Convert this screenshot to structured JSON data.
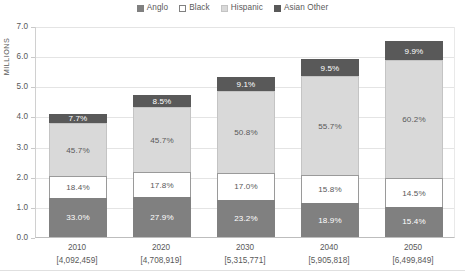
{
  "chart_data": {
    "type": "bar",
    "subtype": "stacked-100-percent",
    "title": "",
    "xlabel": "",
    "ylabel": "MILLIONS",
    "ylim": [
      0.0,
      7.0
    ],
    "ytick_labels": [
      "0.0",
      "1.0",
      "2.0",
      "3.0",
      "4.0",
      "5.0",
      "6.0",
      "7.0"
    ],
    "ytick_values": [
      0.0,
      1.0,
      2.0,
      3.0,
      4.0,
      5.0,
      6.0,
      7.0
    ],
    "grid": true,
    "legend_position": "top-center",
    "categories": [
      "2010",
      "2020",
      "2030",
      "2040",
      "2050"
    ],
    "category_totals_label": [
      "[4,092,459]",
      "[4,708,919]",
      "[5,315,771]",
      "[5,905,818]",
      "[6,499,849]"
    ],
    "category_totals": [
      4092459,
      4708919,
      5315771,
      5905818,
      6499849
    ],
    "series": [
      {
        "name": "Anglo",
        "color": "#808080",
        "border": "#808080",
        "label_on": "dark",
        "values": [
          33.0,
          27.9,
          23.2,
          18.9,
          15.4
        ],
        "value_labels": [
          "33.0%",
          "27.9%",
          "23.2%",
          "18.9%",
          "15.4%"
        ]
      },
      {
        "name": "Black",
        "color": "#ffffff",
        "border": "#9a9a9a",
        "label_on": "light",
        "values": [
          18.4,
          17.8,
          17.0,
          15.8,
          14.5
        ],
        "value_labels": [
          "18.4%",
          "17.8%",
          "17.0%",
          "15.8%",
          "14.5%"
        ]
      },
      {
        "name": "Hispanic",
        "color": "#d9d9d9",
        "border": "#c4c4c4",
        "label_on": "light",
        "values": [
          45.7,
          45.7,
          50.8,
          55.7,
          60.2
        ],
        "value_labels": [
          "45.7%",
          "45.7%",
          "50.8%",
          "55.7%",
          "60.2%"
        ]
      },
      {
        "name": "Asian Other",
        "color": "#595959",
        "border": "#595959",
        "label_on": "dark",
        "values": [
          7.7,
          8.5,
          9.1,
          9.5,
          9.9
        ],
        "value_labels": [
          "7.7%",
          "8.5%",
          "9.1%",
          "9.5%",
          "9.9%"
        ]
      }
    ]
  },
  "legend": {
    "items": [
      {
        "label": "Anglo",
        "color": "#808080",
        "border": "#808080"
      },
      {
        "label": "Black",
        "color": "#ffffff",
        "border": "#808080"
      },
      {
        "label": "Hispanic",
        "color": "#d9d9d9",
        "border": "#c4c4c4"
      },
      {
        "label": "Asian Other",
        "color": "#595959",
        "border": "#595959"
      }
    ]
  },
  "axes": {
    "y_title": "MILLIONS"
  }
}
